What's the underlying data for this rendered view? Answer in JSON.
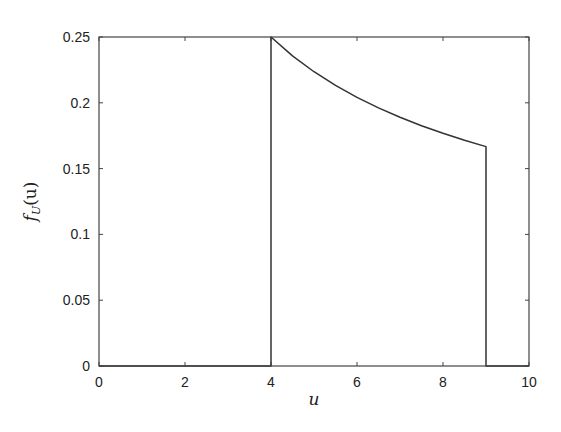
{
  "chart_data": {
    "type": "line",
    "title": "",
    "xlabel": "u",
    "ylabel_parts": {
      "f": "f",
      "sub": "U",
      "arg": "(u)"
    },
    "ylabel": "f_U(u)",
    "xlim": [
      0,
      10
    ],
    "ylim": [
      0,
      0.25
    ],
    "xticks": [
      0,
      2,
      4,
      6,
      8,
      10
    ],
    "xtick_labels": [
      "0",
      "2",
      "4",
      "6",
      "8",
      "10"
    ],
    "yticks": [
      0,
      0.05,
      0.1,
      0.15,
      0.2,
      0.25
    ],
    "ytick_labels": [
      "0",
      "0.05",
      "0.1",
      "0.15",
      "0.2",
      "0.25"
    ],
    "grid": false,
    "legend": null,
    "series": [
      {
        "name": "f_U(u)",
        "description": "density 1/(2*sqrt(u)) on [4, 9], zero elsewhere",
        "color": "#333333",
        "x": [
          0,
          4,
          4,
          4.5,
          5,
          5.5,
          6,
          6.5,
          7,
          7.5,
          8,
          8.5,
          9,
          9,
          10
        ],
        "y": [
          0,
          0,
          0.25,
          0.2357,
          0.2236,
          0.2132,
          0.2041,
          0.1961,
          0.189,
          0.1826,
          0.1768,
          0.1715,
          0.1667,
          0,
          0
        ]
      }
    ]
  }
}
